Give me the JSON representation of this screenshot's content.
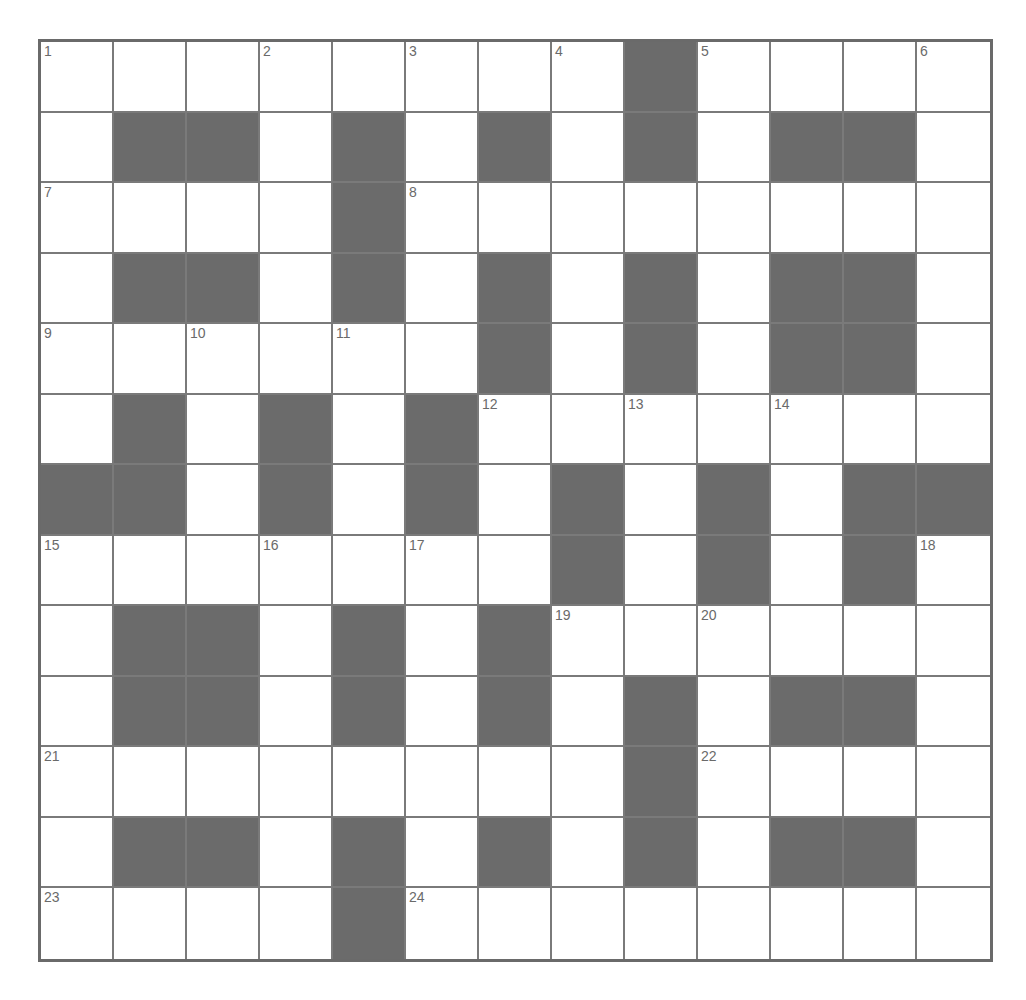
{
  "puzzle": {
    "rows": 13,
    "cols": 13,
    "colors": {
      "block": "#6b6b6b",
      "cell": "#ffffff",
      "line": "#7a7a7a",
      "number": "#6a6a6a"
    },
    "layout": [
      "........#....",
      ".##.#.#.#.##.",
      "....#........",
      ".##.#.#.#.##.",
      "......#.#.##.",
      ".#.#.#.......",
      "##.#.#.#.#.##",
      ".......#.#.#.",
      ".##.#.#......",
      ".##.#.#.#.##.",
      "........#....",
      ".##.#.#.#.##.",
      "....#........"
    ],
    "numbers": [
      {
        "n": "1",
        "r": 0,
        "c": 0
      },
      {
        "n": "2",
        "r": 0,
        "c": 3
      },
      {
        "n": "3",
        "r": 0,
        "c": 5
      },
      {
        "n": "4",
        "r": 0,
        "c": 7
      },
      {
        "n": "5",
        "r": 0,
        "c": 9
      },
      {
        "n": "6",
        "r": 0,
        "c": 12
      },
      {
        "n": "7",
        "r": 2,
        "c": 0
      },
      {
        "n": "8",
        "r": 2,
        "c": 5
      },
      {
        "n": "9",
        "r": 4,
        "c": 0
      },
      {
        "n": "10",
        "r": 4,
        "c": 2
      },
      {
        "n": "11",
        "r": 4,
        "c": 4
      },
      {
        "n": "12",
        "r": 5,
        "c": 6
      },
      {
        "n": "13",
        "r": 5,
        "c": 8
      },
      {
        "n": "14",
        "r": 5,
        "c": 10
      },
      {
        "n": "15",
        "r": 7,
        "c": 0
      },
      {
        "n": "16",
        "r": 7,
        "c": 3
      },
      {
        "n": "17",
        "r": 7,
        "c": 5
      },
      {
        "n": "18",
        "r": 7,
        "c": 12
      },
      {
        "n": "19",
        "r": 8,
        "c": 7
      },
      {
        "n": "20",
        "r": 8,
        "c": 9
      },
      {
        "n": "21",
        "r": 10,
        "c": 0
      },
      {
        "n": "22",
        "r": 10,
        "c": 9
      },
      {
        "n": "23",
        "r": 12,
        "c": 0
      },
      {
        "n": "24",
        "r": 12,
        "c": 5
      }
    ]
  }
}
